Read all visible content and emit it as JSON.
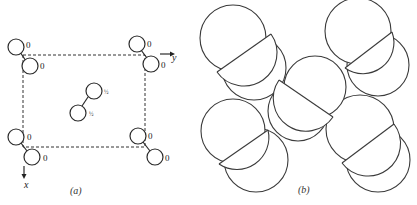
{
  "panel_a": {
    "caption": "(a)",
    "axis_x_label": "x",
    "axis_y_label": "y",
    "height_labels": {
      "corner": "0",
      "center_upper": "½",
      "center_lower": "½"
    },
    "molecules": [
      {
        "name": "top-left",
        "upper_label": "0",
        "lower_label": "0"
      },
      {
        "name": "top-right",
        "upper_label": "0",
        "lower_label": "0"
      },
      {
        "name": "center",
        "upper_label": "½",
        "lower_label": "½"
      },
      {
        "name": "bottom-left",
        "upper_label": "0",
        "lower_label": "0"
      },
      {
        "name": "bottom-right",
        "upper_label": "0",
        "lower_label": "0"
      }
    ]
  },
  "panel_b": {
    "caption": "(b)"
  }
}
